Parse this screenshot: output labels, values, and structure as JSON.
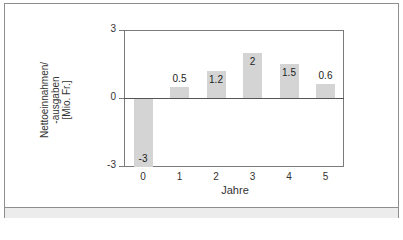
{
  "chart_data": {
    "type": "bar",
    "title": "",
    "xlabel": "Jahre",
    "ylabel": "Nettoeinnahmen/ -ausgaben [Mio. Fr.]",
    "ylabel_lines": [
      "Nettoeinnahmen/",
      "-ausgaben",
      "[Mio. Fr.]"
    ],
    "categories": [
      "0",
      "1",
      "2",
      "3",
      "4",
      "5"
    ],
    "values": [
      -3,
      0.5,
      1.2,
      2,
      1.5,
      0.6
    ],
    "value_labels": [
      "-3",
      "0.5",
      "1.2",
      "2",
      "1.5",
      "0.6"
    ],
    "ylim": [
      -3,
      3
    ],
    "yticks": [
      "3",
      "0",
      "-3"
    ],
    "grid": false,
    "legend": null,
    "bar_color": "#d4d4d4"
  }
}
